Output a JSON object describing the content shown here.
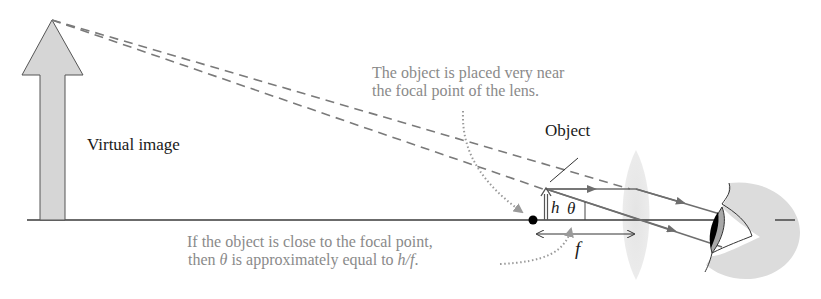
{
  "diagram": {
    "labels": {
      "virtual_image": "Virtual image",
      "object": "Object",
      "h": "h",
      "theta": "θ",
      "f": "f"
    },
    "callouts": {
      "top_line1": "The object is placed very near",
      "top_line2": "the focal point of the lens.",
      "bottom_line1": "If the object is close to the focal point,",
      "bottom_line2_prefix": "then ",
      "bottom_line2_theta": "θ",
      "bottom_line2_mid": " is approximately equal to ",
      "bottom_line2_ratio": "h/f",
      "bottom_line2_suffix": "."
    },
    "colors": {
      "axis": "#3a3a3a",
      "ray": "#6e6e6e",
      "dashed": "#7a7a7a",
      "callout_text": "#8a8a8a",
      "virtual_image_fill": "#d6d6d6",
      "lens_fill": "#e2e2e2",
      "eye_shade": "#dcdcdc",
      "iris": "#a8a8a8",
      "pupil": "#000000",
      "focal_dot": "#000000"
    },
    "elements": [
      {
        "name": "optical-axis"
      },
      {
        "name": "virtual-image-arrow"
      },
      {
        "name": "object-arrow"
      },
      {
        "name": "focal-point"
      },
      {
        "name": "converging-lens"
      },
      {
        "name": "eye"
      },
      {
        "name": "focal-length-dimension"
      }
    ]
  }
}
